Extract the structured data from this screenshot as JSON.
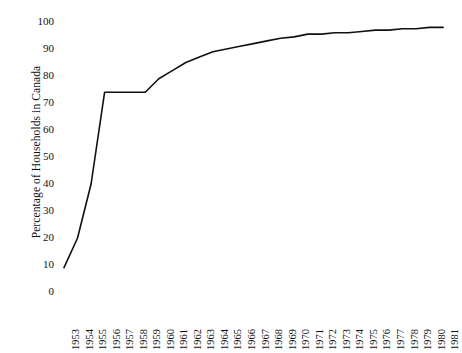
{
  "chart_data": {
    "type": "line",
    "title": "",
    "xlabel": "",
    "ylabel": "Percentage of Households in Canada",
    "ylim": [
      0,
      100
    ],
    "yticks": [
      0,
      10,
      20,
      30,
      40,
      50,
      60,
      70,
      80,
      90,
      100
    ],
    "grid": false,
    "legend": false,
    "line_color": "#111111",
    "categories": [
      "1953",
      "1954",
      "1955",
      "1956",
      "1957",
      "1958",
      "1959",
      "1960",
      "1961",
      "1962",
      "1963",
      "1964",
      "1965",
      "1966",
      "1967",
      "1968",
      "1969",
      "1970",
      "1971",
      "1972",
      "1973",
      "1974",
      "1975",
      "1976",
      "1977",
      "1978",
      "1979",
      "1980",
      "1981"
    ],
    "values": [
      9,
      20,
      40,
      74,
      74,
      74,
      74,
      79,
      82,
      85,
      87,
      89,
      90,
      91,
      92,
      93,
      94,
      94.5,
      95.5,
      95.5,
      96,
      96,
      96.5,
      97,
      97,
      97.5,
      97.5,
      98,
      98
    ],
    "series": [
      {
        "name": "Percentage of Households in Canada",
        "values": [
          9,
          20,
          40,
          74,
          74,
          74,
          74,
          79,
          82,
          85,
          87,
          89,
          90,
          91,
          92,
          93,
          94,
          94.5,
          95.5,
          95.5,
          96,
          96,
          96.5,
          97,
          97,
          97.5,
          97.5,
          98,
          98
        ]
      }
    ]
  },
  "axes": {
    "y_title": "Percentage of Households in Canada",
    "y_tick_labels": [
      "100",
      "90",
      "80",
      "70",
      "60",
      "50",
      "40",
      "30",
      "20",
      "10",
      "0"
    ],
    "x_tick_labels": [
      "1953",
      "1954",
      "1955",
      "1956",
      "1957",
      "1958",
      "1959",
      "1960",
      "1961",
      "1962",
      "1963",
      "1964",
      "1965",
      "1966",
      "1967",
      "1968",
      "1969",
      "1970",
      "1971",
      "1972",
      "1973",
      "1974",
      "1975",
      "1976",
      "1977",
      "1978",
      "1979",
      "1980",
      "1981"
    ]
  }
}
